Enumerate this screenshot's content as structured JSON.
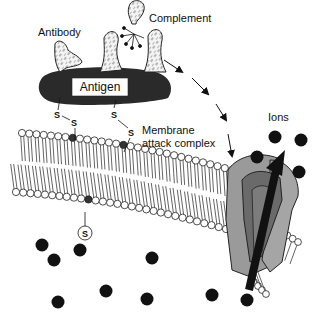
{
  "labels": {
    "antibody": "Antibody",
    "complement": "Complement",
    "antigen": "Antigen",
    "mac_line1": "Membrane",
    "mac_line2": "attack complex",
    "ions": "Ions",
    "s": "S"
  },
  "colors": {
    "antigen_body": "#2a2a2a",
    "protein_fill": "#f2f2f2",
    "pore_outer": "#9a9a9a",
    "pore_inner": "#6a6a6a",
    "ion": "#111111",
    "arrow": "#111111",
    "lipid_head": "#ffffff",
    "lipid_head_marked": "#333333"
  },
  "counts": {
    "ions_visible": 13,
    "complement_proteins": 3,
    "antibodies": 1
  }
}
